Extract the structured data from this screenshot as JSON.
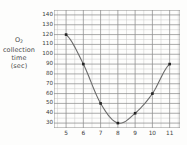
{
  "figure": {
    "y_axis_caption_lines": [
      "O2",
      "collection",
      "time",
      "(sec)"
    ],
    "y_axis_caption_main": "O",
    "y_axis_caption_sub": "2"
  },
  "chart_data": {
    "type": "line",
    "title": "",
    "xlabel": "",
    "ylabel": "O2 collection time (sec)",
    "x": [
      5,
      6,
      7,
      8,
      9,
      10,
      11
    ],
    "values": [
      120,
      90,
      50,
      30,
      40,
      60,
      90
    ],
    "series": [
      {
        "name": "O2 collection time",
        "x": [
          5,
          6,
          7,
          8,
          9,
          10,
          11
        ],
        "values": [
          120,
          90,
          50,
          30,
          40,
          60,
          90
        ]
      }
    ],
    "xlim": [
      4.3,
      11.6
    ],
    "ylim": [
      25,
      145
    ],
    "xticks": [
      5,
      6,
      7,
      8,
      9,
      10,
      11
    ],
    "yticks": [
      140,
      130,
      120,
      110,
      100,
      90,
      80,
      70,
      60,
      50,
      40,
      30
    ],
    "xtick_labels": [
      "5",
      "6",
      "7",
      "8",
      "9",
      "10",
      "11"
    ],
    "ytick_labels": [
      "140",
      "130",
      "120",
      "110",
      "100",
      "90",
      "80",
      "70",
      "60",
      "50",
      "40",
      "30"
    ],
    "grid": true,
    "grid_minor": true,
    "legend": "none",
    "marker": "square",
    "line_color": "#6b6b6b",
    "marker_color": "#222222",
    "grid_major_color": "#8d8d8d",
    "grid_minor_color": "#c8c8c8",
    "annotations": []
  }
}
